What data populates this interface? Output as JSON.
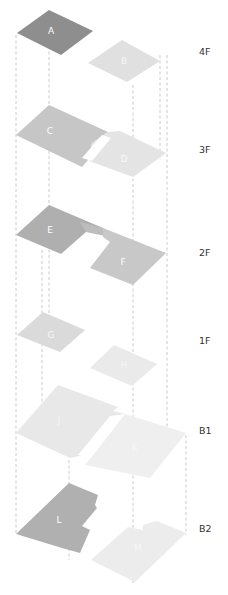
{
  "diagram": {
    "type": "isometric-floor-stack",
    "floors": [
      {
        "id": "4F",
        "label": "4F",
        "label_y": 52,
        "zones": [
          {
            "id": "A",
            "label": "A",
            "color": "#8e8e8e",
            "points": "17,33 49,10 93,31 61,55",
            "lx": 51,
            "ly": 31
          },
          {
            "id": "B",
            "label": "B",
            "color": "#e0e0e0",
            "points": "88,63 122,40 160,61 127,82",
            "lx": 124,
            "ly": 61
          }
        ]
      },
      {
        "id": "3F",
        "label": "3F",
        "label_y": 150,
        "zones": [
          {
            "id": "C",
            "label": "C",
            "color": "#c6c6c6",
            "points": "16,135 49,105 108,132 92,143 88,160 82,167",
            "lx": 50,
            "ly": 131
          },
          {
            "id": "D",
            "label": "D",
            "color": "#e4e4e4",
            "points": "108,132 120,131 166,153 133,177 89,161 92,143",
            "lx": 124,
            "ly": 159
          },
          {
            "id": "gap3",
            "label": "",
            "color": "#ffffff",
            "points": "102,135 111,138 92,161 82,158",
            "lx": 0,
            "ly": 0
          }
        ]
      },
      {
        "id": "2F",
        "label": "2F",
        "label_y": 253,
        "zones": [
          {
            "id": "E",
            "label": "E",
            "color": "#afafaf",
            "points": "16,235 49,205 103,228 86,232 61,254",
            "lx": 50,
            "ly": 230
          },
          {
            "id": "E2",
            "label": "",
            "color": "#bdbdbd",
            "points": "80,222 103,228 105,236 86,232",
            "lx": 0,
            "ly": 0
          },
          {
            "id": "F",
            "label": "F",
            "color": "#c8c8c8",
            "points": "103,228 166,253 133,285 90,268 110,242 103,237",
            "lx": 123,
            "ly": 262
          }
        ]
      },
      {
        "id": "1F",
        "label": "1F",
        "label_y": 341,
        "zones": [
          {
            "id": "G",
            "label": "G",
            "color": "#dadada",
            "points": "17,335 43,312 85,330 60,352",
            "lx": 51,
            "ly": 335
          },
          {
            "id": "H",
            "label": "H",
            "color": "#eaeaea",
            "points": "90,368 114,345 157,364 132,386",
            "lx": 124,
            "ly": 365
          }
        ]
      },
      {
        "id": "B1",
        "label": "B1",
        "label_y": 431,
        "zones": [
          {
            "id": "J",
            "label": "J",
            "color": "#e8e8e8",
            "points": "16,433 58,385 118,407 113,411 125,414 90,454 70,458",
            "lx": 59,
            "ly": 420
          },
          {
            "id": "K",
            "label": "K",
            "color": "#efefef",
            "points": "125,414 186,433 150,478 85,465 113,428",
            "lx": 135,
            "ly": 448
          },
          {
            "id": "gap1",
            "label": "",
            "color": "#ffffff",
            "points": "110,416 125,414 91,458 78,455",
            "lx": 0,
            "ly": 0
          }
        ]
      },
      {
        "id": "B2",
        "label": "B2",
        "label_y": 529,
        "zones": [
          {
            "id": "L",
            "label": "L",
            "color": "#b0b0b0",
            "points": "16,534 69,483 98,495 95,505 97,508 82,526 90,530 80,553 62,548",
            "lx": 59,
            "ly": 520
          },
          {
            "id": "M",
            "label": "M",
            "color": "#ececec",
            "points": "91,560 128,527 143,530 143,525 157,521 186,533 135,582",
            "lx": 138,
            "ly": 548
          }
        ]
      }
    ],
    "verticals": [
      {
        "x": 16,
        "y1": 35,
        "y2": 535
      },
      {
        "x": 49,
        "y1": 35,
        "y2": 335
      },
      {
        "x": 133,
        "y1": 85,
        "y2": 585
      },
      {
        "x": 167,
        "y1": 55,
        "y2": 455
      },
      {
        "x": 160,
        "y1": 55,
        "y2": 160
      },
      {
        "x": 186,
        "y1": 435,
        "y2": 535
      },
      {
        "x": 69,
        "y1": 460,
        "y2": 560
      },
      {
        "x": 42,
        "y1": 250,
        "y2": 420
      }
    ]
  }
}
